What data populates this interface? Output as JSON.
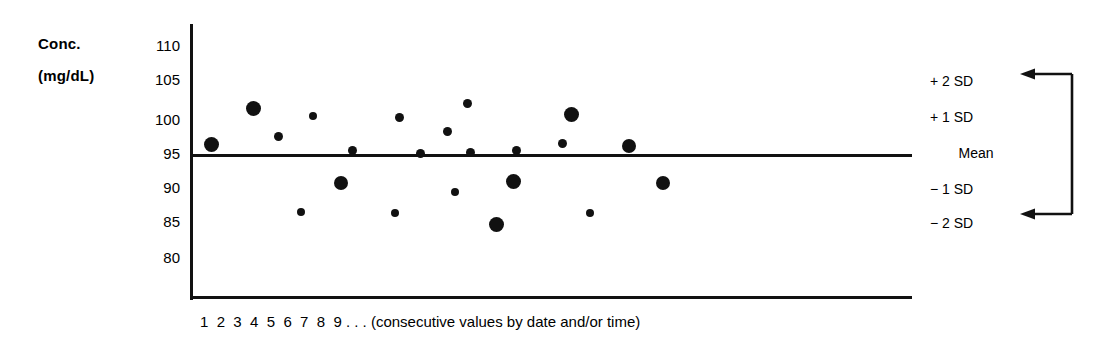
{
  "chart_data": {
    "type": "scatter",
    "title": "",
    "ylabel": "Conc. (mg/dL)",
    "xlabel": "1 2 3 4 5 6 7 8 9 . . . (consecutive values by date and/or time)",
    "ylim": [
      78,
      112
    ],
    "yticks": [
      110,
      105,
      100,
      95,
      90,
      85,
      80
    ],
    "xticks": [
      "1",
      "2",
      "3",
      "4",
      "5",
      "6",
      "7",
      "8",
      "9"
    ],
    "grid": false,
    "legend_position": "right",
    "mean_value": 93.5,
    "reference_lines": [
      {
        "name": "Mean",
        "value": 93.5,
        "drawn": true
      }
    ],
    "marker_color": "#111111",
    "x": [
      1,
      2,
      3,
      4,
      5,
      6,
      7,
      8,
      9,
      10,
      11,
      12,
      13,
      14,
      15,
      16,
      17,
      18,
      19,
      20,
      21,
      22,
      23,
      24
    ],
    "points": [
      {
        "n": 1,
        "x": 211,
        "y": 95.6,
        "size": "large"
      },
      {
        "n": 2,
        "x": 253,
        "y": 100.3,
        "size": "large"
      },
      {
        "n": 3,
        "x": 278,
        "y": 96.7,
        "size": "small"
      },
      {
        "n": 4,
        "x": 313,
        "y": 99.4,
        "size": "small"
      },
      {
        "n": 5,
        "x": 301,
        "y": 86.0,
        "size": "small"
      },
      {
        "n": 6,
        "x": 352,
        "y": 94.9,
        "size": "small"
      },
      {
        "n": 7,
        "x": 351,
        "y": 89.6,
        "size": "large"
      },
      {
        "n": 8,
        "x": 395,
        "y": 85.8,
        "size": "small"
      },
      {
        "n": 9,
        "x": 399,
        "y": 99.2,
        "size": "small"
      },
      {
        "n": 10,
        "x": 420,
        "y": 94.6,
        "size": "small"
      },
      {
        "n": 11,
        "x": 455,
        "y": 88.9,
        "size": "small"
      },
      {
        "n": 12,
        "x": 470,
        "y": 94.5,
        "size": "small"
      },
      {
        "n": 13,
        "x": 467,
        "y": 101.3,
        "size": "small"
      },
      {
        "n": 14,
        "x": 496,
        "y": 84.5,
        "size": "large"
      },
      {
        "n": 15,
        "x": 513,
        "y": 89.2,
        "size": "large"
      },
      {
        "n": 16,
        "x": 516,
        "y": 94.4,
        "size": "small"
      },
      {
        "n": 17,
        "x": 515,
        "y": 96.3,
        "size": "small"
      },
      {
        "n": 18,
        "x": 571,
        "y": 99.8,
        "size": "large"
      },
      {
        "n": 19,
        "x": 562,
        "y": 96.4,
        "size": "small"
      },
      {
        "n": 20,
        "x": 590,
        "y": 85.5,
        "size": "small"
      },
      {
        "n": 21,
        "x": 629,
        "y": 95.2,
        "size": "large"
      },
      {
        "n": 22,
        "x": 663,
        "y": 89.6,
        "size": "large"
      },
      {
        "n": 23,
        "x": 341,
        "y": 89.7,
        "size": "large"
      },
      {
        "n": 24,
        "x": 447,
        "y": 97.0,
        "size": "small"
      }
    ]
  },
  "y_axis": {
    "title_line1": "Conc.",
    "title_line2": "(mg/dL)",
    "ticks": [
      {
        "label": "110",
        "top": 38
      },
      {
        "label": "105",
        "top": 72
      },
      {
        "label": "100",
        "top": 112
      },
      {
        "label": "95",
        "top": 146
      },
      {
        "label": "90",
        "top": 180
      },
      {
        "label": "85",
        "top": 214
      },
      {
        "label": "80",
        "top": 250
      }
    ]
  },
  "x_axis": {
    "caption": "1  2  3  4  5  6  7  8  9 . . . (consecutive values by date and/or time)"
  },
  "sd_legend": {
    "items": [
      {
        "label": "+ 2 SD",
        "top": 74,
        "align": "left"
      },
      {
        "label": "+ 1 SD",
        "top": 110,
        "align": "left"
      },
      {
        "label": "Mean",
        "top": 146,
        "align": "center"
      },
      {
        "label": "− 1 SD",
        "top": 182,
        "align": "left"
      },
      {
        "label": "− 2 SD",
        "top": 216,
        "align": "left"
      }
    ],
    "bracket": "arrow-bracket-icon"
  },
  "markers": [
    {
      "cx": 211,
      "cy": 144,
      "r": 7.5
    },
    {
      "cx": 253,
      "cy": 108,
      "r": 7.5
    },
    {
      "cx": 278,
      "cy": 136,
      "r": 4.5
    },
    {
      "cx": 313,
      "cy": 116,
      "r": 4.0
    },
    {
      "cx": 301,
      "cy": 212,
      "r": 4.0
    },
    {
      "cx": 341,
      "cy": 183,
      "r": 7.0
    },
    {
      "cx": 352,
      "cy": 150,
      "r": 4.5
    },
    {
      "cx": 395,
      "cy": 213,
      "r": 4.0
    },
    {
      "cx": 399,
      "cy": 117,
      "r": 4.5
    },
    {
      "cx": 420,
      "cy": 153,
      "r": 4.5
    },
    {
      "cx": 447,
      "cy": 131,
      "r": 4.5
    },
    {
      "cx": 455,
      "cy": 192,
      "r": 4.0
    },
    {
      "cx": 470,
      "cy": 152,
      "r": 4.5
    },
    {
      "cx": 467,
      "cy": 103,
      "r": 4.5
    },
    {
      "cx": 496,
      "cy": 224,
      "r": 7.5
    },
    {
      "cx": 513,
      "cy": 181,
      "r": 7.5
    },
    {
      "cx": 516,
      "cy": 150,
      "r": 4.5
    },
    {
      "cx": 562,
      "cy": 143,
      "r": 4.5
    },
    {
      "cx": 571,
      "cy": 114,
      "r": 7.5
    },
    {
      "cx": 590,
      "cy": 213,
      "r": 4.0
    },
    {
      "cx": 629,
      "cy": 146,
      "r": 7.0
    },
    {
      "cx": 663,
      "cy": 183,
      "r": 7.0
    }
  ]
}
